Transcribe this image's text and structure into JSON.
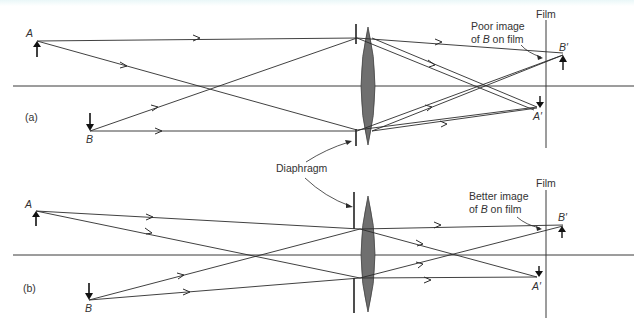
{
  "figure": {
    "panels": [
      {
        "id": "a",
        "label": "(a)",
        "object_top_label": "A",
        "object_bottom_label": "B",
        "image_top_label": "B′",
        "image_bottom_label": "A′",
        "film_label": "Film",
        "annotation_line1": "Poor image",
        "annotation_line2_prefix": "of ",
        "annotation_line2_italic": "B",
        "annotation_line2_suffix": " on film"
      },
      {
        "id": "b",
        "label": "(b)",
        "object_top_label": "A",
        "object_bottom_label": "B",
        "image_top_label": "B′",
        "image_bottom_label": "A′",
        "film_label": "Film",
        "annotation_line1": "Better image",
        "annotation_line2_prefix": "of ",
        "annotation_line2_italic": "B",
        "annotation_line2_suffix": " on film"
      }
    ],
    "shared_label": "Diaphragm",
    "colors": {
      "line": "#2b2b2b",
      "lens_fill": "#6f6f6f",
      "text": "#333333",
      "axis": "#3a3a3a"
    }
  }
}
